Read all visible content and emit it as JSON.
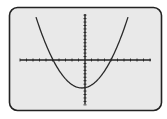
{
  "screen": {
    "frame_color": "#222222",
    "screen_color": "#e9e9e9",
    "axis_color": "#222222",
    "curve_color": "#2a2a2a"
  },
  "chart_data": {
    "type": "line",
    "title": "",
    "xlabel": "",
    "ylabel": "",
    "grid": false,
    "legend": null,
    "axes": {
      "x_axis_ticks_left_of_origin": 10,
      "x_axis_ticks_right_of_origin": 10,
      "y_axis_ticks_above_origin": 13,
      "y_axis_ticks_below_origin": 13
    },
    "series": [
      {
        "name": "parabola",
        "shape": "upward parabola",
        "features": {
          "x_intercepts": 2,
          "vertex_position": "below x-axis, slightly left of y-axis",
          "opens": "up"
        }
      }
    ]
  }
}
